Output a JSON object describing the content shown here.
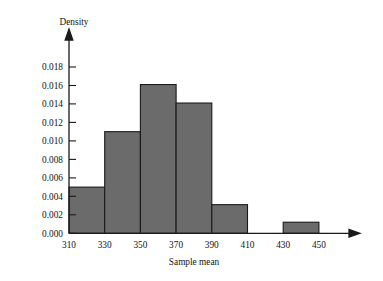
{
  "chart_data": {
    "type": "bar",
    "title": "",
    "subtitle": "",
    "xlabel": "Sample mean",
    "ylabel": "Density",
    "bin_width": 20,
    "bin_edges": [
      310,
      330,
      350,
      370,
      390,
      410,
      430,
      450
    ],
    "categories": [
      "310-330",
      "330-350",
      "350-370",
      "370-390",
      "390-410",
      "410-430",
      "430-450"
    ],
    "values": [
      0.005,
      0.011,
      0.0161,
      0.0141,
      0.0031,
      0.0,
      0.0012
    ],
    "series": [
      {
        "name": "Density",
        "values": [
          0.005,
          0.011,
          0.0161,
          0.0141,
          0.0031,
          0.0,
          0.0012
        ]
      }
    ],
    "xlim": [
      300,
      460
    ],
    "ylim": [
      0.0,
      0.019
    ],
    "xticks": [
      310,
      330,
      350,
      370,
      390,
      410,
      430,
      450
    ],
    "xtick_labels": [
      "310",
      "330",
      "350",
      "370",
      "390",
      "410",
      "430",
      "450"
    ],
    "yticks": [
      0.0,
      0.002,
      0.004,
      0.006,
      0.008,
      0.01,
      0.012,
      0.014,
      0.016,
      0.018
    ],
    "ytick_labels": [
      "0.000",
      "0.002",
      "0.004",
      "0.006",
      "0.008",
      "0.010",
      "0.012",
      "0.014",
      "0.016",
      "0.018"
    ],
    "grid": false,
    "legend": null,
    "bar_fill_color": "#6b6b6b",
    "bar_edge_color": "#1a1a1a",
    "axis_color": "#1a1a1a",
    "background_color": "#ffffff",
    "x_axis_arrow": true,
    "y_axis_arrow": true
  },
  "axes": {
    "y_title": "Density",
    "x_title": "Sample mean"
  },
  "ytick_labels": {
    "t0": "0.000",
    "t1": "0.002",
    "t2": "0.004",
    "t3": "0.006",
    "t4": "0.008",
    "t5": "0.010",
    "t6": "0.012",
    "t7": "0.014",
    "t8": "0.016",
    "t9": "0.018"
  },
  "xtick_labels": {
    "t0": "310",
    "t1": "330",
    "t2": "350",
    "t3": "370",
    "t4": "390",
    "t5": "410",
    "t6": "430",
    "t7": "450"
  }
}
